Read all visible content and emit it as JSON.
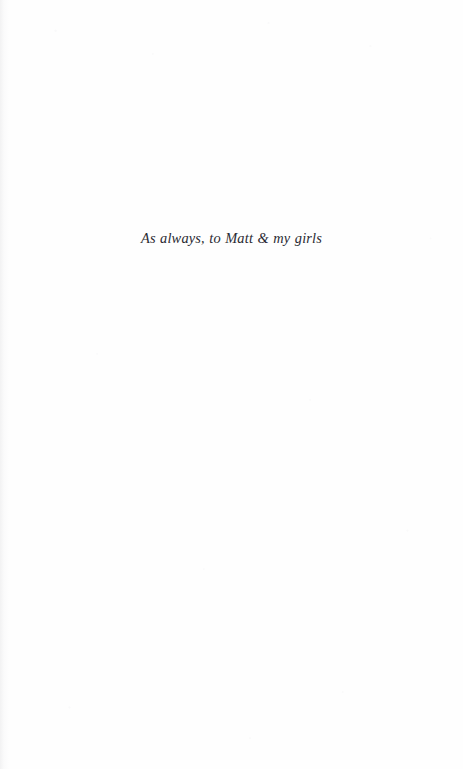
{
  "page": {
    "kind": "book-dedication-page",
    "background_color": "#fefefe",
    "text_color": "#2b2b33",
    "width_px": 463,
    "height_px": 769
  },
  "dedication": {
    "text": "As always, to Matt & my girls"
  }
}
